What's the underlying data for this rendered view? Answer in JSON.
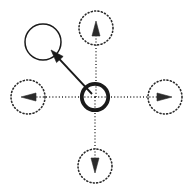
{
  "canvas": {
    "width": 186,
    "height": 187,
    "background": "#ffffff",
    "title": "Radial state transition diagram"
  },
  "style": {
    "ink": "#1a1a1a",
    "dotted_ink": "#2b2b2b",
    "center_stroke_width": 3.8,
    "node_stroke_width": 1.5,
    "dotted_node_stroke_width": 1.6,
    "dotted_dash": "1 2.4",
    "connector_stroke_width": 1.9,
    "dotted_connector_dash": "1 2.2"
  },
  "nodes": {
    "center": {
      "label": "center-node",
      "cx": 95,
      "cy": 97,
      "r": 13.2,
      "variant": "solid-thick",
      "stroke": "#1a1a1a"
    },
    "selected": {
      "label": "selected-node",
      "cx": 43,
      "cy": 42,
      "r": 18,
      "variant": "solid-thin",
      "stroke": "#1a1a1a"
    },
    "candidates": [
      {
        "label": "candidate-node-up",
        "direction": "up",
        "cx": 96,
        "cy": 28,
        "r": 17,
        "variant": "dotted",
        "stroke": "#2b2b2b"
      },
      {
        "label": "candidate-node-right",
        "direction": "right",
        "cx": 165,
        "cy": 97,
        "r": 17,
        "variant": "dotted",
        "stroke": "#2b2b2b"
      },
      {
        "label": "candidate-node-down",
        "direction": "down",
        "cx": 95,
        "cy": 166,
        "r": 17,
        "variant": "dotted",
        "stroke": "#2b2b2b"
      },
      {
        "label": "candidate-node-left",
        "direction": "left",
        "cx": 28,
        "cy": 97,
        "r": 17,
        "variant": "dotted",
        "stroke": "#2b2b2b"
      }
    ]
  },
  "connectors": {
    "selected_arrow": {
      "label": "selected-transition-arrow",
      "variant": "solid",
      "x1": 92,
      "y1": 94,
      "x2": 51,
      "y2": 50,
      "head_length": 13,
      "head_width": 9,
      "stroke": "#1a1a1a"
    },
    "candidate_arrows": [
      {
        "label": "candidate-arrow-up",
        "direction": "up",
        "variant": "dotted",
        "x1": 96,
        "y1": 97,
        "x2": 96,
        "y2": 21,
        "head_length": 15,
        "head_width": 8,
        "stroke": "#2b2b2b"
      },
      {
        "label": "candidate-arrow-right",
        "direction": "right",
        "variant": "dotted",
        "x1": 95,
        "y1": 97,
        "x2": 172,
        "y2": 97,
        "head_length": 15,
        "head_width": 8,
        "stroke": "#2b2b2b"
      },
      {
        "label": "candidate-arrow-down",
        "direction": "down",
        "variant": "dotted",
        "x1": 95,
        "y1": 97,
        "x2": 95,
        "y2": 173,
        "head_length": 15,
        "head_width": 8,
        "stroke": "#2b2b2b"
      },
      {
        "label": "candidate-arrow-left",
        "direction": "left",
        "variant": "dotted",
        "x1": 95,
        "y1": 97,
        "x2": 21,
        "y2": 97,
        "head_length": 15,
        "head_width": 8,
        "stroke": "#2b2b2b"
      }
    ]
  }
}
